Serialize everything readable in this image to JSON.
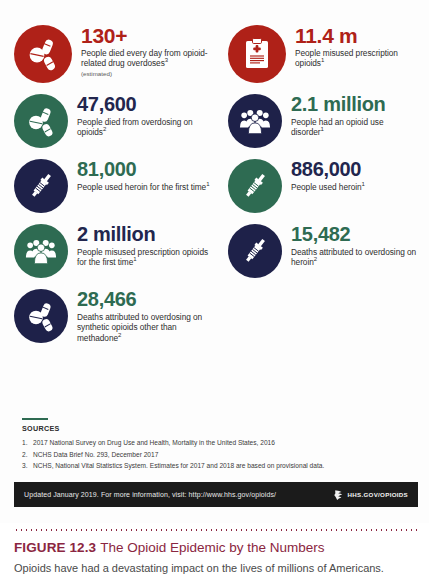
{
  "figure": {
    "label": "FIGURE 12.3",
    "title": "The Opioid Epidemic by the Numbers",
    "subtitle": "Opioids have had a devastating impact on the lives of millions of Americans."
  },
  "colors": {
    "red": "#AF2118",
    "green": "#2E6B52",
    "navy": "#1E2149",
    "number_green": "#2E6B52",
    "number_navy": "#22264E",
    "number_red": "#AF2118",
    "caption_maroon": "#8B2641",
    "footer_bg": "#1B1B1B"
  },
  "stats": [
    {
      "number": "130+",
      "desc": "People died every day from opioid-related drug overdoses",
      "footnote": "3",
      "note": "(estimated)",
      "icon": "pills-icon",
      "badge_color": "#AF2118",
      "number_color": "#AF2118"
    },
    {
      "number": "11.4 m",
      "desc": "People misused prescription opioids",
      "footnote": "1",
      "note": "",
      "icon": "prescription-clipboard-icon",
      "badge_color": "#AF2118",
      "number_color": "#AF2118"
    },
    {
      "number": "47,600",
      "desc": "People died from overdosing on opioids",
      "footnote": "2",
      "note": "",
      "icon": "pills-icon",
      "badge_color": "#2E6B52",
      "number_color": "#22264E"
    },
    {
      "number": "2.1 million",
      "desc": "People had an opioid use disorder",
      "footnote": "1",
      "note": "",
      "icon": "people-group-icon",
      "badge_color": "#1E2149",
      "number_color": "#2E6B52"
    },
    {
      "number": "81,000",
      "desc": "People used heroin for the first time",
      "footnote": "1",
      "note": "",
      "icon": "syringe-icon",
      "badge_color": "#1E2149",
      "number_color": "#2E6B52"
    },
    {
      "number": "886,000",
      "desc": "People used heroin",
      "footnote": "1",
      "note": "",
      "icon": "syringe-icon",
      "badge_color": "#2E6B52",
      "number_color": "#22264E"
    },
    {
      "number": "2 million",
      "desc": "People misused prescription opioids for the first time",
      "footnote": "1",
      "note": "",
      "icon": "people-group-icon",
      "badge_color": "#2E6B52",
      "number_color": "#22264E"
    },
    {
      "number": "15,482",
      "desc": "Deaths attributed to overdosing on heroin",
      "footnote": "2",
      "note": "",
      "icon": "syringe-icon",
      "badge_color": "#1E2149",
      "number_color": "#2E6B52"
    },
    {
      "number": "28,466",
      "desc": "Deaths attributed to overdosing on synthetic opioids other than methadone",
      "footnote": "2",
      "note": "",
      "icon": "pills-icon",
      "badge_color": "#1E2149",
      "number_color": "#2E6B52"
    }
  ],
  "sources": {
    "heading": "SOURCES",
    "items": [
      {
        "num": "1.",
        "text": "2017 National Survey on Drug Use and Health, Mortality in the United States, 2016"
      },
      {
        "num": "2.",
        "text": "NCHS Data Brief No. 293, December 2017"
      },
      {
        "num": "3.",
        "text": "NCHS, National Vital Statistics System. Estimates for 2017 and 2018 are based on provisional data."
      }
    ]
  },
  "footer": {
    "text": "Updated January 2019. For more information, visit: http://www.hhs.gov/opioids/",
    "logo_text": "HHS.GOV/OPIOIDS"
  }
}
